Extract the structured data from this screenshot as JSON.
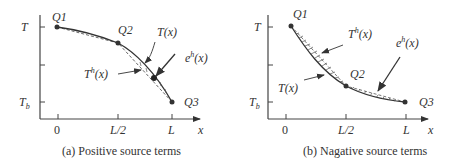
{
  "panels": [
    {
      "id": "a",
      "caption": "(a) Positive source terms",
      "y_ticks": {
        "top": "T",
        "bottom_base": "T",
        "bottom_sub": "b"
      },
      "x_ticks": [
        "0",
        "L/2",
        "L"
      ],
      "x_axis_label": "x",
      "points": {
        "q1": "Q1",
        "q2": "Q2",
        "q3": "Q3"
      },
      "curves": {
        "exact": "T(x)",
        "approx_base": "T",
        "approx_sup": "h",
        "approx_arg": "(x)",
        "error_base": "e",
        "error_sup": "h",
        "error_arg": "(x)"
      }
    },
    {
      "id": "b",
      "caption": "(b) Nagative source terms",
      "y_ticks": {
        "top": "T",
        "bottom_base": "T",
        "bottom_sub": "b"
      },
      "x_ticks": [
        "0",
        "L/2",
        "L"
      ],
      "x_axis_label": "x",
      "points": {
        "q1": "Q1",
        "q2": "Q2",
        "q3": "Q3"
      },
      "curves": {
        "exact": "T(x)",
        "approx_base": "T",
        "approx_sup": "h",
        "approx_arg": "(x)",
        "error_base": "e",
        "error_sup": "h",
        "error_arg": "(x)"
      }
    }
  ],
  "colors": {
    "ink": "#333333",
    "background": "#ffffff"
  }
}
